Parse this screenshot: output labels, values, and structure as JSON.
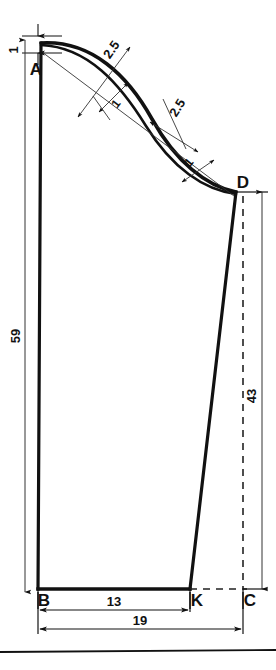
{
  "drawing": {
    "title_visible": false,
    "type": "technical-pattern-drawing",
    "points": {
      "a": "A",
      "b": "B",
      "c": "C",
      "d": "D",
      "k": "K"
    },
    "dimensions": {
      "top_offset": "1",
      "left_height": "59",
      "right_height": "43",
      "bottom_inner": "13",
      "bottom_outer": "19",
      "curve_offset_1": "2.5",
      "curve_tick_1": "1",
      "curve_offset_2": "2.5",
      "curve_tick_2": "1"
    },
    "colors": {
      "ink": "#111111",
      "thin": "#333333",
      "dashed": "#222222"
    }
  }
}
